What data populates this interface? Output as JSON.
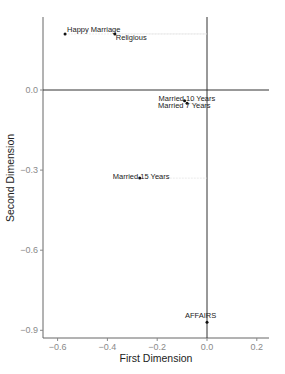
{
  "chart_data": {
    "type": "scatter",
    "title": "",
    "xlabel": "First Dimension",
    "ylabel": "Second Dimension",
    "xlim": [
      -0.65,
      0.25
    ],
    "ylim": [
      -0.94,
      0.27
    ],
    "x_ticks": [
      -0.6,
      -0.4,
      -0.2,
      0.0,
      0.2
    ],
    "x_tick_labels": [
      "−0.6",
      "−0.4",
      "−0.2",
      "0.0",
      "0.2"
    ],
    "y_ticks": [
      0.0,
      -0.3,
      -0.6,
      -0.9
    ],
    "y_tick_labels": [
      "0.0",
      "−0.3",
      "−0.6",
      "−0.9"
    ],
    "grid": false,
    "reference_lines": {
      "x": 0.0,
      "y": 0.0
    },
    "points": [
      {
        "label": "Happy Marriage",
        "x": -0.57,
        "y": 0.21
      },
      {
        "label": "Religious",
        "x": -0.37,
        "y": 0.21
      },
      {
        "label": "Married 10 Years",
        "x": -0.09,
        "y": -0.04
      },
      {
        "label": "Married 7 Years",
        "x": -0.08,
        "y": -0.05
      },
      {
        "label": "Married 15 Years",
        "x": -0.27,
        "y": -0.33
      },
      {
        "label": "AFFAIRS",
        "x": 0.0,
        "y": -0.87
      }
    ]
  },
  "colors": {
    "point": "#111111",
    "axis": "#555555",
    "ref_line": "#333333",
    "tick_label": "#8a8a8a",
    "leader": "#dddddd"
  }
}
